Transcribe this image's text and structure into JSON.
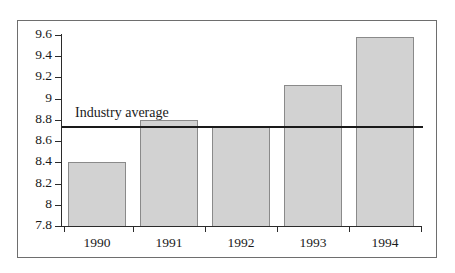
{
  "chart_data": {
    "type": "bar",
    "title": "",
    "xlabel": "",
    "ylabel": "",
    "categories": [
      "1990",
      "1991",
      "1992",
      "1993",
      "1994"
    ],
    "values": [
      8.4,
      8.8,
      8.73,
      9.13,
      9.58
    ],
    "ylim": [
      7.8,
      9.6
    ],
    "yticks": [
      "9.6",
      "9.4",
      "9.2",
      "9",
      "8.8",
      "8.6",
      "8.4",
      "8.2",
      "8",
      "7.8"
    ],
    "ytick_values": [
      9.6,
      9.4,
      9.2,
      9.0,
      8.8,
      8.6,
      8.4,
      8.2,
      8.0,
      7.8
    ],
    "grid": false,
    "legend": "none",
    "annotations": [
      {
        "name": "industry-average",
        "label": "Industry average",
        "value": 8.73,
        "type": "horizontal-reference-line"
      }
    ],
    "colors": {
      "bar_fill": "#d2d2d2",
      "bar_edge": "#8a8a8a",
      "axis": "#2b2b2b",
      "average_line": "#1a1a1a",
      "frame": "#6e6e6e",
      "background": "#ffffff"
    }
  }
}
